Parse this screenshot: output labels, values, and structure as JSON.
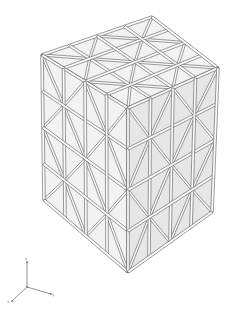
{
  "scene": {
    "description": "Wireframe lattice cube built from triangular struts, 4x4 subdivision per face",
    "subdivisions": 4,
    "colors": {
      "background": "#ffffff",
      "face_fill": "#f2f2f2",
      "face_fill_dark": "#e6e6e6",
      "strut_stroke": "#4a4a4a",
      "strut_fill": "#fbfbfb"
    },
    "corners": {
      "top_back": [
        152,
        17
      ],
      "top_left": [
        42,
        55
      ],
      "top_right": [
        218,
        68
      ],
      "top_front": [
        128,
        108
      ],
      "bottom_left": [
        44,
        200
      ],
      "bottom_right": [
        212,
        212
      ],
      "bottom_front": [
        128,
        272
      ]
    }
  },
  "axis_triad": {
    "origin": [
      27,
      287
    ],
    "axes": [
      {
        "name": "z",
        "label": "z",
        "end": [
          27,
          262
        ]
      },
      {
        "name": "y",
        "label": "y",
        "end": [
          51,
          294
        ]
      },
      {
        "name": "x",
        "label": "x",
        "end": [
          12,
          301
        ]
      }
    ],
    "color": "#777777"
  }
}
